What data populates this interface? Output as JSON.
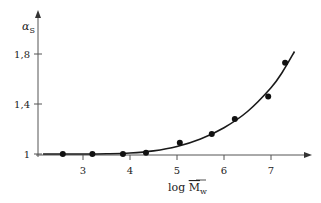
{
  "chart_data": {
    "type": "scatter",
    "title": "",
    "xlabel": "log M̄w",
    "xlabel_parts": {
      "prefix": "log ",
      "symbol": "M",
      "subscript": "w"
    },
    "ylabel": "αS",
    "ylabel_parts": {
      "symbol": "α",
      "subscript": "S"
    },
    "xlim": [
      2.1,
      7.8
    ],
    "ylim": [
      0.98,
      2.0
    ],
    "x_ticks": [
      3,
      4,
      5,
      6,
      7
    ],
    "x_tick_labels": [
      "3",
      "4",
      "5",
      "6",
      "7"
    ],
    "y_ticks": [
      1.0,
      1.4,
      1.8
    ],
    "y_tick_labels": [
      "1",
      "1,4",
      "1,8"
    ],
    "grid": false,
    "legend": "none",
    "series": [
      {
        "name": "measured",
        "kind": "points",
        "x": [
          2.57,
          3.2,
          3.85,
          4.34,
          5.06,
          5.74,
          6.23,
          6.94,
          7.3
        ],
        "y": [
          1.0,
          1.0,
          1.0,
          1.01,
          1.09,
          1.16,
          1.28,
          1.46,
          1.73
        ]
      },
      {
        "name": "fit",
        "kind": "line",
        "x": [
          2.15,
          2.5,
          3.0,
          3.5,
          4.0,
          4.5,
          5.0,
          5.5,
          6.0,
          6.5,
          7.0,
          7.25,
          7.5
        ],
        "y": [
          1.0,
          1.0,
          1.0,
          1.002,
          1.008,
          1.025,
          1.06,
          1.12,
          1.21,
          1.34,
          1.53,
          1.66,
          1.82
        ]
      }
    ]
  }
}
